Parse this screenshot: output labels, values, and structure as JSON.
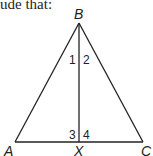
{
  "caption": "ude that:",
  "diagram": {
    "type": "triangle with altitude",
    "vertices": {
      "A": {
        "label": "A",
        "x": 15,
        "y": 142
      },
      "B": {
        "label": "B",
        "x": 79,
        "y": 23
      },
      "C": {
        "label": "C",
        "x": 143,
        "y": 142
      },
      "X": {
        "label": "X",
        "x": 79,
        "y": 142
      }
    },
    "segments": [
      "AB",
      "BC",
      "AC",
      "BX"
    ],
    "angle_labels": {
      "a1": "1",
      "a2": "2",
      "a3": "3",
      "a4": "4"
    },
    "stroke_color": "#222222"
  }
}
